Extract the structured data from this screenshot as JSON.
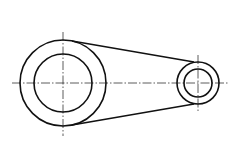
{
  "drawing": {
    "type": "mechanical-link-front-view",
    "stroke_color": "#111111",
    "background": "#ffffff",
    "large_boss": {
      "cx": 63,
      "cy": 83,
      "outer_r": 43,
      "inner_r": 29
    },
    "small_boss": {
      "cx": 198,
      "cy": 83,
      "outer_r": 21,
      "inner_r": 14
    },
    "centerline_horizontal": {
      "x1": 12,
      "x2": 228,
      "y": 83
    },
    "caption": ""
  }
}
